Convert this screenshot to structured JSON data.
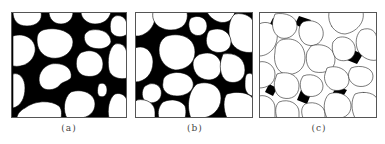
{
  "figure": {
    "panels": [
      {
        "id": "a",
        "caption": "(a)",
        "description": "grains floating in dense matrix",
        "matrix_color": "#000000"
      },
      {
        "id": "b",
        "caption": "(b)",
        "description": "grains in contact with matrix filling voids",
        "matrix_color": "#000000"
      },
      {
        "id": "c",
        "caption": "(c)",
        "description": "closely packed grains with little matrix",
        "matrix_color": "#000000"
      }
    ],
    "colors": {
      "matrix": "#000000",
      "grain": "#ffffff",
      "frame": "#555555",
      "caption": "#444444"
    }
  }
}
